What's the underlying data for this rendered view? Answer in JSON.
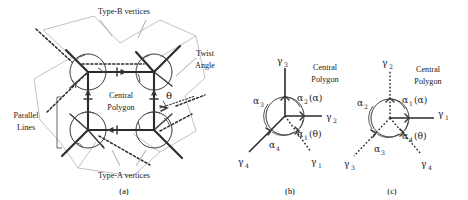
{
  "figure": {
    "caption_a": "(a)",
    "caption_b": "(b)",
    "caption_c": "(c)"
  },
  "panel_a": {
    "label_type_b": "Type-B vertices",
    "label_type_a": "Type-A vertices",
    "label_central_line1": "Central",
    "label_central_line2": "Polygon",
    "label_parallel_line1": "Parallel",
    "label_parallel_line2": "Lines",
    "label_twist_line1": "Twist",
    "label_twist_line2": "Angle",
    "twist_angle_symbol": "θ",
    "colors": {
      "solid_link": "#2b2b2b",
      "faint_link": "#b6b6b6",
      "vertex_circle": "#3a3a3a"
    }
  },
  "panel_b": {
    "label_central_line1": "Central",
    "label_central_line2": "Polygon",
    "gamma": {
      "g1_base": "γ",
      "g1_sub": "1",
      "g2_base": "γ",
      "g2_sub": "2",
      "g3_base": "γ",
      "g3_sub": "3",
      "g4_base": "γ",
      "g4_sub": "4"
    },
    "alpha": {
      "a1_base": "α",
      "a1_sub": "1",
      "a1_paren": "(θ)",
      "a2_base": "α",
      "a2_sub": "2",
      "a2_paren": "(α)",
      "a3_base": "α",
      "a3_sub": "3",
      "a4_base": "α",
      "a4_sub": "4"
    }
  },
  "panel_c": {
    "label_central_line1": "Central",
    "label_central_line2": "Polygon",
    "gamma": {
      "g1_base": "γ",
      "g1_sub": "1",
      "g2_base": "γ",
      "g2_sub": "2",
      "g3_base": "γ",
      "g3_sub": "3",
      "g4_base": "γ",
      "g4_sub": "4"
    },
    "alpha": {
      "a1_base": "α",
      "a1_sub": "1",
      "a1_paren": "(α)",
      "a2_base": "α",
      "a2_sub": "2",
      "a3_base": "α",
      "a3_sub": "3",
      "a4_base": "α",
      "a4_sub": "4",
      "a4_paren": "(θ)"
    }
  }
}
